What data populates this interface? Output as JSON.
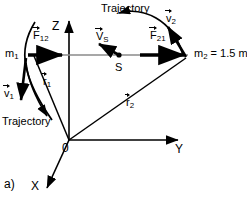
{
  "figure": {
    "panel_label": "a)",
    "background": "#ffffff",
    "ink": "#000000",
    "axis_gray": "#6e6e6e"
  },
  "axes": [
    {
      "name": "z-axis",
      "label": "Z",
      "direction": "up"
    },
    {
      "name": "y-axis",
      "label": "Y",
      "direction": "right"
    },
    {
      "name": "x-axis",
      "label": "X",
      "direction": "down-left"
    }
  ],
  "origin": {
    "label": "0"
  },
  "bodies": [
    {
      "name": "mass-1",
      "label": "m",
      "sub": "1"
    },
    {
      "name": "mass-2",
      "label": "m",
      "sub": "2",
      "relation": "= 1.5 m",
      "relation_sub": "1"
    },
    {
      "name": "center-of-mass",
      "label": "S"
    }
  ],
  "vectors": {
    "force_12": {
      "symbol": "F",
      "sub": "12"
    },
    "force_21": {
      "symbol": "F",
      "sub": "21"
    },
    "velocity_1": {
      "symbol": "v",
      "sub": "1"
    },
    "velocity_2": {
      "symbol": "v",
      "sub": "2"
    },
    "velocity_s": {
      "symbol": "V",
      "sub": "S"
    },
    "position_1": {
      "symbol": "r",
      "sub": "1"
    },
    "position_2": {
      "symbol": "r",
      "sub": "2"
    }
  },
  "annotations": {
    "trajectory_top": "Trajectory",
    "trajectory_left": "Trajectory"
  }
}
